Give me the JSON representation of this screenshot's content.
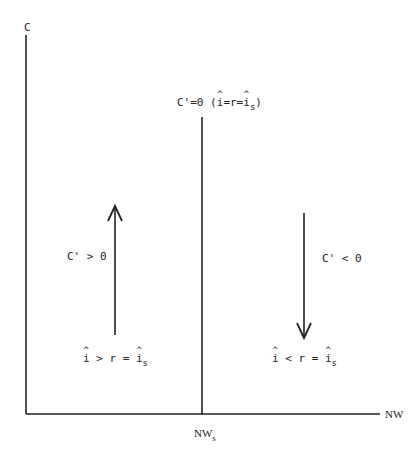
{
  "diagram": {
    "axes": {
      "y_label": "C",
      "x_label": "NW",
      "x_tick_label": "NW",
      "x_tick_subscript": "s"
    },
    "steady_state_line": {
      "label_prefix": "C'=0 (",
      "label_i": "i",
      "label_mid": "=r=",
      "label_i2": "i",
      "label_sub": "s",
      "label_suffix": ")"
    },
    "left_region": {
      "growth_label": "C' > 0",
      "cond_i": "i",
      "cond_mid": " > r = ",
      "cond_i2": "i",
      "cond_sub": "s",
      "arrow_direction": "up"
    },
    "right_region": {
      "growth_label": "C' < 0",
      "cond_i": "i",
      "cond_mid": " < r = ",
      "cond_i2": "i",
      "cond_sub": "s",
      "arrow_direction": "down"
    },
    "colors": {
      "line": "#222222",
      "background": "#ffffff"
    }
  }
}
